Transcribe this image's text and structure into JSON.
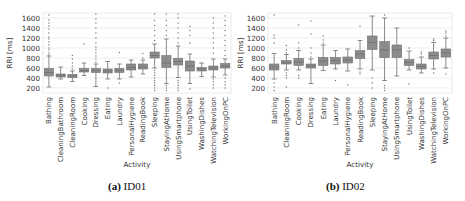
{
  "chart_data": [
    {
      "type": "box",
      "title": "",
      "caption_label": "(a)",
      "caption_text": "ID01",
      "xlabel": "Activity",
      "ylabel": "RRI [ms]",
      "ylim": [
        100,
        1700
      ],
      "yticks": [
        200,
        400,
        600,
        800,
        1000,
        1200,
        1400,
        1600
      ],
      "grid": true,
      "categories": [
        "Bathing",
        "CleaningBathroom",
        "CleaningRoom",
        "Cooking",
        "Dressing",
        "Eating",
        "Laundry",
        "PersonalHygiene",
        "ReadingBook",
        "Sleeping",
        "StayingAtHome",
        "UsingSmartphone",
        "UsingToilet",
        "WashingDishes",
        "WatchingTelevision",
        "WorkingOnPC"
      ],
      "boxes": [
        {
          "q1": 440,
          "median": 510,
          "q3": 590,
          "whisker_low": 220,
          "whisker_high": 840,
          "outliers": [
            860,
            900,
            960,
            1000,
            1060,
            1120,
            1180,
            1220,
            1300,
            1380,
            1440,
            1500,
            1560,
            1660
          ]
        },
        {
          "q1": 420,
          "median": 450,
          "q3": 480,
          "whisker_low": 380,
          "whisker_high": 620,
          "outliers": []
        },
        {
          "q1": 410,
          "median": 440,
          "q3": 470,
          "whisker_low": 330,
          "whisker_high": 540,
          "outliers": [
            580,
            640,
            700,
            780,
            850
          ]
        },
        {
          "q1": 520,
          "median": 550,
          "q3": 590,
          "whisker_low": 450,
          "whisker_high": 700,
          "outliers": [
            1080
          ]
        },
        {
          "q1": 510,
          "median": 550,
          "q3": 590,
          "whisker_low": 230,
          "whisker_high": 680,
          "outliers": [
            720,
            780,
            840,
            900,
            960,
            1020,
            1100,
            1200,
            1300,
            1400,
            1500,
            1580,
            1680
          ]
        },
        {
          "q1": 500,
          "median": 540,
          "q3": 580,
          "whisker_low": 380,
          "whisker_high": 730,
          "outliers": [
            200
          ]
        },
        {
          "q1": 510,
          "median": 550,
          "q3": 590,
          "whisker_low": 380,
          "whisker_high": 680,
          "outliers": [
            910,
            300
          ]
        },
        {
          "q1": 560,
          "median": 610,
          "q3": 680,
          "whisker_low": 420,
          "whisker_high": 760,
          "outliers": []
        },
        {
          "q1": 580,
          "median": 620,
          "q3": 680,
          "whisker_low": 480,
          "whisker_high": 760,
          "outliers": [
            800,
            890
          ]
        },
        {
          "q1": 800,
          "median": 850,
          "q3": 920,
          "whisker_low": 600,
          "whisker_high": 1080,
          "outliers": [
            150,
            200,
            250,
            300,
            350,
            400,
            450,
            500,
            550,
            1150,
            1250,
            1350,
            1450,
            1550,
            1680
          ]
        },
        {
          "q1": 610,
          "median": 700,
          "q3": 850,
          "whisker_low": 290,
          "whisker_high": 1180,
          "outliers": [
            150,
            200,
            250,
            1250,
            1350,
            1450,
            1550,
            1680
          ]
        },
        {
          "q1": 660,
          "median": 730,
          "q3": 790,
          "whisker_low": 410,
          "whisker_high": 1040,
          "outliers": [
            150,
            200,
            250,
            300,
            350,
            1100,
            1200,
            1300,
            1400,
            1500,
            1600,
            1680
          ]
        },
        {
          "q1": 540,
          "median": 640,
          "q3": 740,
          "whisker_low": 290,
          "whisker_high": 880,
          "outliers": [
            180,
            1100,
            1250,
            1350,
            1430
          ]
        },
        {
          "q1": 540,
          "median": 580,
          "q3": 610,
          "whisker_low": 430,
          "whisker_high": 700,
          "outliers": []
        },
        {
          "q1": 560,
          "median": 600,
          "q3": 640,
          "whisker_low": 420,
          "whisker_high": 780,
          "outliers": [
            200,
            260,
            320,
            380,
            900,
            1000,
            1100,
            1200,
            1300,
            1400,
            1500,
            1600
          ]
        },
        {
          "q1": 600,
          "median": 640,
          "q3": 690,
          "whisker_low": 460,
          "whisker_high": 780,
          "outliers": [
            200,
            260,
            320,
            400,
            850,
            950,
            1050,
            1150,
            1250,
            1350,
            1450,
            1550,
            1640
          ]
        }
      ]
    },
    {
      "type": "box",
      "title": "",
      "caption_label": "(b)",
      "caption_text": "ID02",
      "xlabel": "Activity",
      "ylabel": "RRI [ms]",
      "ylim": [
        100,
        1700
      ],
      "yticks": [
        200,
        400,
        600,
        800,
        1000,
        1200,
        1400,
        1600
      ],
      "grid": true,
      "categories": [
        "Bathing",
        "CleaningRoom",
        "Cooking",
        "Dressing",
        "Eating",
        "Laundry",
        "PersonalHygiene",
        "ReadingBook",
        "Sleeping",
        "StayingAtHome",
        "UsingSmartphone",
        "UsingToilet",
        "WashingDishes",
        "WatchingTelevision",
        "WorkingOnPC"
      ],
      "boxes": [
        {
          "q1": 560,
          "median": 620,
          "q3": 680,
          "whisker_low": 380,
          "whisker_high": 890,
          "outliers": [
            150,
            220,
            300,
            1100,
            1200,
            1260,
            1660
          ]
        },
        {
          "q1": 680,
          "median": 710,
          "q3": 750,
          "whisker_low": 560,
          "whisker_high": 870,
          "outliers": [
            220,
            400,
            450,
            500,
            900,
            960,
            1050
          ]
        },
        {
          "q1": 650,
          "median": 720,
          "q3": 790,
          "whisker_low": 560,
          "whisker_high": 950,
          "outliers": [
            400,
            450,
            1000,
            1100,
            1460
          ]
        },
        {
          "q1": 600,
          "median": 640,
          "q3": 680,
          "whisker_low": 290,
          "whisker_high": 780,
          "outliers": [
            820,
            900,
            1000,
            1280,
            1540
          ]
        },
        {
          "q1": 650,
          "median": 740,
          "q3": 810,
          "whisker_low": 550,
          "whisker_high": 1060,
          "outliers": [
            1100,
            1160,
            1240
          ]
        },
        {
          "q1": 680,
          "median": 750,
          "q3": 810,
          "whisker_low": 580,
          "whisker_high": 950,
          "outliers": [
            350
          ]
        },
        {
          "q1": 700,
          "median": 760,
          "q3": 820,
          "whisker_low": 540,
          "whisker_high": 980,
          "outliers": [
            260
          ]
        },
        {
          "q1": 790,
          "median": 880,
          "q3": 950,
          "whisker_low": 580,
          "whisker_high": 1150,
          "outliers": [
            480,
            520,
            1440
          ]
        },
        {
          "q1": 970,
          "median": 1110,
          "q3": 1240,
          "whisker_low": 560,
          "whisker_high": 1640,
          "outliers": [
            200,
            300,
            400
          ]
        },
        {
          "q1": 810,
          "median": 960,
          "q3": 1130,
          "whisker_low": 350,
          "whisker_high": 1600,
          "outliers": [
            150,
            200,
            250,
            1660
          ]
        },
        {
          "q1": 810,
          "median": 960,
          "q3": 1060,
          "whisker_low": 440,
          "whisker_high": 1400,
          "outliers": []
        },
        {
          "q1": 650,
          "median": 710,
          "q3": 770,
          "whisker_low": 560,
          "whisker_high": 940,
          "outliers": [
            280,
            1000
          ]
        },
        {
          "q1": 580,
          "median": 630,
          "q3": 680,
          "whisker_low": 500,
          "whisker_high": 820,
          "outliers": [
            880,
            920
          ]
        },
        {
          "q1": 780,
          "median": 850,
          "q3": 920,
          "whisker_low": 580,
          "whisker_high": 1110,
          "outliers": [
            500,
            1150,
            1180
          ]
        },
        {
          "q1": 820,
          "median": 900,
          "q3": 980,
          "whisker_low": 600,
          "whisker_high": 1200,
          "outliers": [
            480,
            1240,
            1300,
            1340
          ]
        }
      ]
    }
  ],
  "colors": {
    "box_fill": "#8c8c8c",
    "box_edge": "#6e6e6e",
    "whisker": "#6e6e6e",
    "outlier": "#707070",
    "grid": "#e6e6e6",
    "axis_text": "#333333",
    "frame": "#dddddd"
  }
}
